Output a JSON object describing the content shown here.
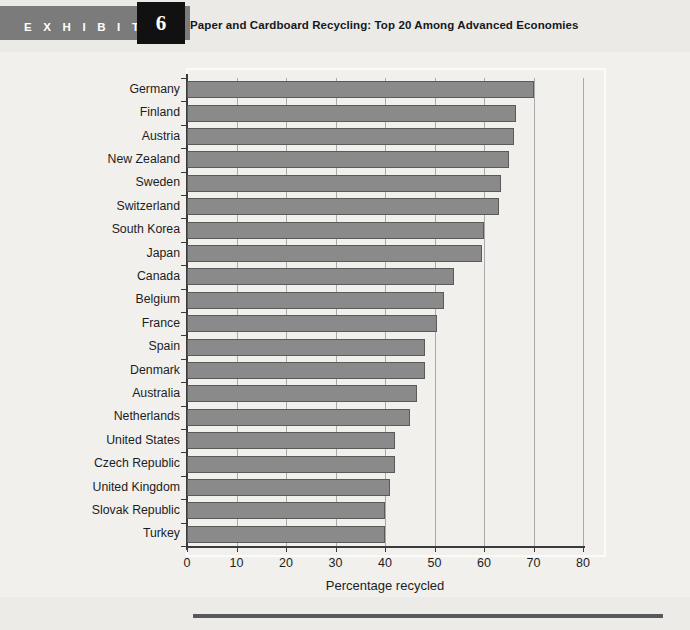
{
  "header": {
    "exhibit_word": "E X H I B I T",
    "exhibit_number": "6",
    "title": "Paper and Cardboard Recycling: Top 20 Among Advanced Economies"
  },
  "footer": {
    "note": ""
  },
  "colors": {
    "bar_fill": "#8a8a8a",
    "bar_stroke": "#5a5a5a",
    "exhibit_tab": "#7b7b7b",
    "exhibit_number_box": "#111111",
    "page_background": "#f1f0ed",
    "axis": "#3b3b3b",
    "gridline": "#a9a9a9",
    "footer_rule": "#58595b"
  },
  "chart_data": {
    "type": "bar",
    "orientation": "horizontal",
    "title": "Paper and Cardboard Recycling: Top 20 Among Advanced Economies",
    "xlabel": "Percentage recycled",
    "ylabel": "",
    "xlim": [
      0,
      80
    ],
    "xticks": [
      0,
      10,
      20,
      30,
      40,
      50,
      60,
      70,
      80
    ],
    "xtick_labels": [
      "0",
      "10",
      "20",
      "30",
      "40",
      "50",
      "60",
      "70",
      "80"
    ],
    "grid": "vertical",
    "legend": "none",
    "categories": [
      "Germany",
      "Finland",
      "Austria",
      "New Zealand",
      "Sweden",
      "Switzerland",
      "South Korea",
      "Japan",
      "Canada",
      "Belgium",
      "France",
      "Spain",
      "Denmark",
      "Australia",
      "Netherlands",
      "United States",
      "Czech Republic",
      "United Kingdom",
      "Slovak Republic",
      "Turkey"
    ],
    "values": [
      70.0,
      66.5,
      66.0,
      65.0,
      63.5,
      63.0,
      60.0,
      59.5,
      54.0,
      52.0,
      50.5,
      48.0,
      48.0,
      46.5,
      45.0,
      42.0,
      42.0,
      41.0,
      40.0,
      40.0
    ]
  }
}
